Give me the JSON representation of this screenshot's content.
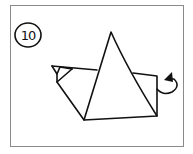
{
  "diagram": {
    "type": "origami-instruction-step",
    "step_number": "10",
    "colors": {
      "stroke": "#111111",
      "frame": "#8a8a8a",
      "background": "#ffffff"
    },
    "elements": [
      {
        "name": "step-number-badge",
        "shape": "circle",
        "label": "10"
      },
      {
        "name": "center-triangle",
        "shape": "triangle",
        "description": "large upright triangle (folded point)"
      },
      {
        "name": "left-flap",
        "shape": "polygon",
        "description": "left side flap with small tucked corner triangle"
      },
      {
        "name": "right-flap",
        "shape": "rectangle",
        "description": "right side flap behind triangle"
      },
      {
        "name": "fold-arrow",
        "shape": "curved-arrow",
        "description": "curved arrow indicating fold behind on the right side"
      }
    ]
  }
}
